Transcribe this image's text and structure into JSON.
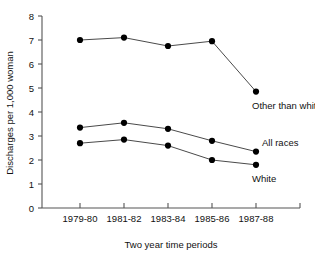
{
  "chart_data": {
    "type": "line",
    "title": "",
    "xlabel": "Two year time periods",
    "ylabel": "Discharges per 1,000 woman",
    "categories": [
      "1979-80",
      "1981-82",
      "1983-84",
      "1985-86",
      "1987-88"
    ],
    "ylim": [
      0,
      8
    ],
    "yticks": [
      0,
      1,
      2,
      3,
      4,
      5,
      6,
      7,
      8
    ],
    "ytick_labels": [
      "0",
      "1",
      "2",
      "3",
      "4",
      "5",
      "6",
      "7",
      "8"
    ],
    "grid": false,
    "legend_position": "inline-right-of-last-point",
    "series": [
      {
        "name": "Other than white",
        "values": [
          7.0,
          7.1,
          6.75,
          6.95,
          4.85
        ]
      },
      {
        "name": "All races",
        "values": [
          3.35,
          3.55,
          3.3,
          2.8,
          2.35
        ]
      },
      {
        "name": "White",
        "values": [
          2.7,
          2.85,
          2.6,
          2.0,
          1.8
        ]
      }
    ],
    "annotations": [
      {
        "text": "Other than white",
        "series": "Other than white"
      },
      {
        "text": "All races",
        "series": "All races"
      },
      {
        "text": "White",
        "series": "White"
      }
    ],
    "colors": {
      "marker": "#000000",
      "line": "#4a4a4a",
      "axis": "#555555",
      "background": "#ffffff"
    }
  }
}
